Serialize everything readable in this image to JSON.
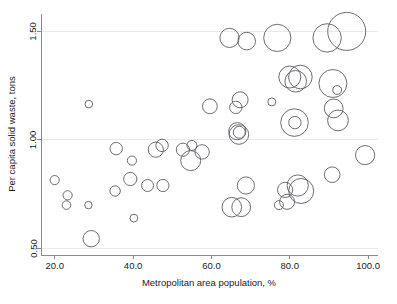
{
  "chart_data": {
    "type": "scatter",
    "title": "",
    "subtitle": "",
    "xlabel": "Metropolitan area population, %",
    "ylabel": "Per capita solid waste, tons",
    "xlim": [
      16.5,
      102.5
    ],
    "ylim": [
      0.47,
      1.58
    ],
    "xticks": [
      20.0,
      40.0,
      60.0,
      80.0,
      100.0
    ],
    "xtick_labels": [
      "20.0",
      "40.0",
      "60.0",
      "80.0",
      "100.0"
    ],
    "yticks": [
      0.5,
      1.0,
      1.5
    ],
    "ytick_labels": [
      "0.50",
      "1.00",
      "1.50"
    ],
    "grid": "horizontal",
    "legend": "none",
    "marker": "open-circle",
    "size_encoding": "bubble-area",
    "points": [
      {
        "x": 20.0,
        "y": 0.815,
        "r": 4.6
      },
      {
        "x": 23.3,
        "y": 0.745,
        "r": 4.6
      },
      {
        "x": 23.0,
        "y": 0.7,
        "r": 4.3
      },
      {
        "x": 28.6,
        "y": 0.7,
        "r": 3.7
      },
      {
        "x": 28.7,
        "y": 1.165,
        "r": 3.8
      },
      {
        "x": 29.3,
        "y": 0.545,
        "r": 8.2
      },
      {
        "x": 35.7,
        "y": 0.96,
        "r": 6.2
      },
      {
        "x": 35.4,
        "y": 0.765,
        "r": 5.2
      },
      {
        "x": 39.7,
        "y": 0.905,
        "r": 4.6
      },
      {
        "x": 39.3,
        "y": 0.82,
        "r": 6.6
      },
      {
        "x": 40.2,
        "y": 0.64,
        "r": 3.9
      },
      {
        "x": 43.7,
        "y": 0.79,
        "r": 6.0
      },
      {
        "x": 45.8,
        "y": 0.955,
        "r": 7.6
      },
      {
        "x": 47.4,
        "y": 0.975,
        "r": 6.2
      },
      {
        "x": 47.6,
        "y": 0.79,
        "r": 6.1
      },
      {
        "x": 52.7,
        "y": 0.955,
        "r": 6.6
      },
      {
        "x": 55.0,
        "y": 0.975,
        "r": 5.0
      },
      {
        "x": 54.7,
        "y": 0.905,
        "r": 10.0
      },
      {
        "x": 57.6,
        "y": 0.945,
        "r": 7.2
      },
      {
        "x": 59.6,
        "y": 1.155,
        "r": 7.4
      },
      {
        "x": 64.6,
        "y": 1.47,
        "r": 9.6
      },
      {
        "x": 65.2,
        "y": 0.69,
        "r": 9.8
      },
      {
        "x": 67.6,
        "y": 0.69,
        "r": 9.4
      },
      {
        "x": 66.2,
        "y": 1.15,
        "r": 6.2
      },
      {
        "x": 67.3,
        "y": 1.185,
        "r": 8.0
      },
      {
        "x": 66.6,
        "y": 1.04,
        "r": 8.6
      },
      {
        "x": 67.0,
        "y": 1.025,
        "r": 9.8
      },
      {
        "x": 67.1,
        "y": 1.035,
        "r": 6.0
      },
      {
        "x": 69.0,
        "y": 1.455,
        "r": 8.8
      },
      {
        "x": 68.8,
        "y": 0.79,
        "r": 8.6
      },
      {
        "x": 75.4,
        "y": 1.175,
        "r": 4.0
      },
      {
        "x": 76.8,
        "y": 1.47,
        "r": 13.6
      },
      {
        "x": 77.2,
        "y": 0.7,
        "r": 4.5
      },
      {
        "x": 78.8,
        "y": 0.77,
        "r": 7.6
      },
      {
        "x": 79.3,
        "y": 0.715,
        "r": 7.5
      },
      {
        "x": 80.0,
        "y": 1.29,
        "r": 11.0
      },
      {
        "x": 81.5,
        "y": 1.27,
        "r": 10.8
      },
      {
        "x": 82.7,
        "y": 1.29,
        "r": 11.8
      },
      {
        "x": 81.2,
        "y": 1.08,
        "r": 13.8
      },
      {
        "x": 81.3,
        "y": 1.08,
        "r": 6.2
      },
      {
        "x": 82.0,
        "y": 0.79,
        "r": 10.6
      },
      {
        "x": 82.9,
        "y": 0.765,
        "r": 12.5
      },
      {
        "x": 89.5,
        "y": 1.47,
        "r": 14.2
      },
      {
        "x": 91.0,
        "y": 1.26,
        "r": 14.0
      },
      {
        "x": 91.2,
        "y": 1.145,
        "r": 9.4
      },
      {
        "x": 92.1,
        "y": 1.23,
        "r": 4.4
      },
      {
        "x": 92.3,
        "y": 1.09,
        "r": 10.4
      },
      {
        "x": 90.8,
        "y": 0.84,
        "r": 7.8
      },
      {
        "x": 94.5,
        "y": 1.5,
        "r": 19.0
      },
      {
        "x": 99.2,
        "y": 0.93,
        "r": 9.6
      }
    ]
  },
  "axes": {
    "y_title": "Per capita solid waste, tons",
    "x_title": "Metropolitan area population, %",
    "y_labels": [
      "1.50",
      "1.00",
      "0.50"
    ],
    "x_labels": [
      "20.0",
      "40.0",
      "60.0",
      "80.0",
      "100.0"
    ]
  }
}
